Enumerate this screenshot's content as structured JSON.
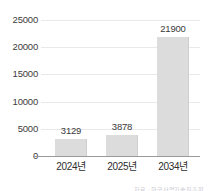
{
  "chart_data": {
    "type": "bar",
    "title": "",
    "subtitle": "",
    "xlabel": "",
    "ylabel": "",
    "categories": [
      "2024년",
      "2025년",
      "2034년"
    ],
    "values": [
      3129,
      3878,
      21900
    ],
    "value_labels": [
      "3129",
      "3878",
      "21900"
    ],
    "series": [
      {
        "name": "",
        "values": [
          3129,
          3878,
          21900
        ]
      }
    ],
    "ylim": [
      0,
      25000
    ],
    "ytick_values": [
      0,
      5000,
      10000,
      15000,
      20000,
      25000
    ],
    "ytick_labels": [
      "0",
      "5000",
      "10000",
      "15000",
      "20000",
      "25000"
    ],
    "grid": true,
    "legend": false,
    "legend_position": "none",
    "bar_color": "#dcdcdc",
    "grid_color": "#e9e9e9",
    "axis_color": "#9a9a9a",
    "text_color": "#3a3a3a",
    "background_color": "#ffffff"
  },
  "annotations": {
    "source_note": "자료 : 한국산업기술진흥원"
  }
}
